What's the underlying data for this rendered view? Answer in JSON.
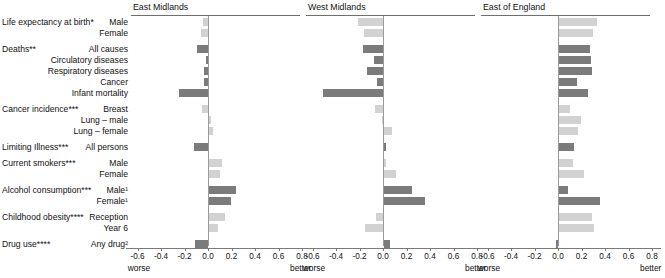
{
  "figure": {
    "worse_label": "worse",
    "better_label": "better",
    "color_dark": "#7b7b7b",
    "color_light": "#d2d2d2",
    "axis_ticks": [
      "-0.6",
      "-0.4",
      "-0.2",
      "0.0",
      "0.2",
      "0.4",
      "0.6",
      "0.8"
    ],
    "axis_tick_values": [
      -0.6,
      -0.4,
      -0.2,
      0.0,
      0.2,
      0.4,
      0.6,
      0.8
    ],
    "axis_min": -0.7,
    "axis_max": 0.88
  },
  "groups": [
    {
      "label": "Life expectancy at birth*",
      "rows": [
        "Male",
        "Female"
      ]
    },
    {
      "label": "Deaths**",
      "rows": [
        "All causes",
        "Circulatory diseases",
        "Respiratory diseases",
        "Cancer",
        "Infant mortality"
      ]
    },
    {
      "label": "Cancer incidence***",
      "rows": [
        "Breast",
        "Lung – male",
        "Lung – female"
      ]
    },
    {
      "label": "Limiting Illness***",
      "rows": [
        "All persons"
      ]
    },
    {
      "label": "Current smokers***",
      "rows": [
        "Male",
        "Female"
      ]
    },
    {
      "label": "Alcohol consumption***",
      "rows": [
        "Male¹",
        "Female¹"
      ]
    },
    {
      "label": "Childhood obesity****",
      "rows": [
        "Reception",
        "Year 6"
      ]
    },
    {
      "label": "Drug use****",
      "rows": [
        "Any drug²"
      ]
    }
  ],
  "row_names": [
    "Male",
    "Female",
    "All causes",
    "Circulatory diseases",
    "Respiratory diseases",
    "Cancer",
    "Infant mortality",
    "Breast",
    "Lung – male",
    "Lung – female",
    "All persons",
    "Male",
    "Female",
    "Male¹",
    "Female¹",
    "Reception",
    "Year 6",
    "Any drug²"
  ],
  "chart_data": {
    "type": "bar",
    "title": "",
    "xlabel": "",
    "ylabel": "",
    "orientation": "horizontal",
    "xlim": [
      -0.7,
      0.88
    ],
    "grid": false,
    "legend": null,
    "categories": [
      "Life expectancy at birth* – Male",
      "Life expectancy at birth* – Female",
      "Deaths** – All causes",
      "Deaths** – Circulatory diseases",
      "Deaths** – Respiratory diseases",
      "Deaths** – Cancer",
      "Deaths** – Infant mortality",
      "Cancer incidence*** – Breast",
      "Cancer incidence*** – Lung – male",
      "Cancer incidence*** – Lung – female",
      "Limiting Illness*** – All persons",
      "Current smokers*** – Male",
      "Current smokers*** – Female",
      "Alcohol consumption*** – Male¹",
      "Alcohol consumption*** – Female¹",
      "Childhood obesity**** – Reception",
      "Childhood obesity**** – Year 6",
      "Drug use**** – Any drug²"
    ],
    "series": [
      {
        "name": "East Midlands",
        "values": [
          -0.04,
          -0.06,
          -0.09,
          -0.02,
          -0.03,
          -0.03,
          -0.25,
          -0.05,
          0.0,
          0.03,
          -0.12,
          0.11,
          0.09,
          0.23,
          0.19,
          0.14,
          0.08,
          -0.11
        ],
        "colors": [
          "light",
          "light",
          "dark",
          "dark",
          "dark",
          "dark",
          "dark",
          "light",
          "light",
          "light",
          "dark",
          "light",
          "light",
          "dark",
          "dark",
          "light",
          "light",
          "dark"
        ]
      },
      {
        "name": "West Midlands",
        "values": [
          -0.21,
          -0.16,
          -0.17,
          -0.08,
          -0.14,
          -0.05,
          -0.51,
          -0.07,
          -0.01,
          0.07,
          0.0,
          0.0,
          0.1,
          0.24,
          0.35,
          -0.06,
          -0.15,
          0.05
        ],
        "colors": [
          "light",
          "light",
          "dark",
          "dark",
          "dark",
          "dark",
          "dark",
          "light",
          "light",
          "light",
          "dark",
          "light",
          "light",
          "dark",
          "dark",
          "light",
          "light",
          "dark"
        ]
      },
      {
        "name": "East of England",
        "values": [
          0.32,
          0.29,
          0.26,
          0.27,
          0.28,
          0.15,
          0.25,
          0.09,
          0.19,
          0.16,
          0.13,
          0.12,
          0.21,
          0.08,
          0.35,
          0.28,
          0.3,
          -0.02
        ],
        "colors": [
          "light",
          "light",
          "dark",
          "dark",
          "dark",
          "dark",
          "dark",
          "light",
          "light",
          "light",
          "dark",
          "light",
          "light",
          "dark",
          "dark",
          "light",
          "light",
          "dark"
        ]
      }
    ]
  },
  "panels": [
    {
      "title": "East Midlands",
      "left": 131,
      "width": 173,
      "zero_x": 77,
      "unit_px": 117.5
    },
    {
      "title": "West Midlands",
      "left": 306,
      "width": 173,
      "zero_x": 77,
      "unit_px": 117.5
    },
    {
      "title": "East of England",
      "left": 481,
      "width": 173,
      "zero_x": 77,
      "unit_px": 117.5
    }
  ],
  "row_layout": {
    "tops": [
      18,
      29,
      45,
      56,
      67,
      78,
      89,
      105,
      116,
      127,
      143,
      159,
      170,
      186,
      197,
      213,
      224,
      240
    ],
    "group_label_tops": [
      18,
      45,
      105,
      143,
      159,
      186,
      213,
      240
    ]
  }
}
